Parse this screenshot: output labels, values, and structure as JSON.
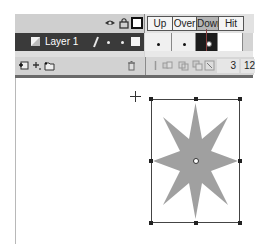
{
  "timeline": {
    "header_icons": [
      "eye-icon",
      "lock-icon",
      "outline-icon"
    ],
    "frame_labels": [
      {
        "label": "Up",
        "active": false
      },
      {
        "label": "Over",
        "active": false
      },
      {
        "label": "Down",
        "active": true
      },
      {
        "label": "Hit",
        "active": false
      }
    ],
    "layers": [
      {
        "name": "Layer 1",
        "selected": true,
        "icons": [
          "layer-icon",
          "pencil-icon",
          "visibility-dot",
          "lock-dot",
          "outline-square"
        ]
      }
    ],
    "frames": [
      {
        "state": "keyframe"
      },
      {
        "state": "keyframe"
      },
      {
        "state": "selected-keyframe"
      },
      {
        "state": "empty"
      }
    ],
    "footer": {
      "left_icons": [
        "insert-layer-icon",
        "add-motion-guide-icon",
        "insert-folder-icon",
        "delete-layer-icon"
      ],
      "right_icons": [
        "center-frame-icon",
        "onion-skin-icon",
        "onion-skin-outlines-icon",
        "edit-multiple-frames-icon",
        "modify-onion-markers-icon"
      ],
      "current_frame": "3",
      "frame_rate": "12"
    },
    "colors": {
      "panel": "#d4d4d4",
      "layer_selected": "#3a3a3a",
      "frame_selected": "#1c1c1c",
      "playhead": "#8a4040"
    }
  },
  "stage": {
    "shape": "eight-point-star",
    "shape_fill": "#a0a0a0",
    "selected": true,
    "bounding_box": {
      "x": 151,
      "y": 99,
      "width": 89,
      "height": 124
    },
    "transform_point": {
      "x": 196,
      "y": 161
    }
  }
}
